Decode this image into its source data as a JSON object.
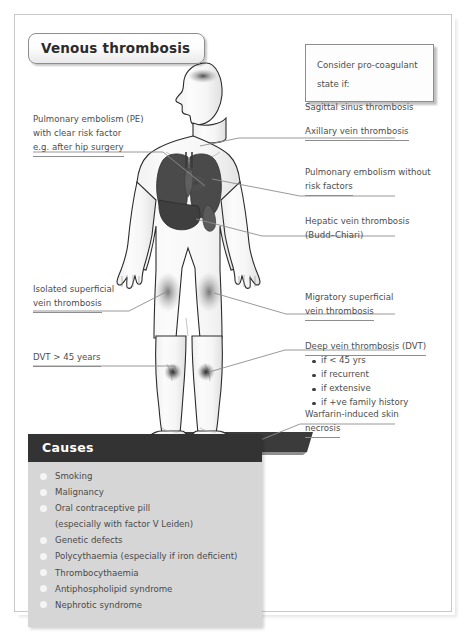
{
  "page": {
    "title_chip": "Venous thrombosis"
  },
  "pro_coagulant_box": {
    "line1": "Consider pro-coagulant",
    "line2": "state if:"
  },
  "labels": {
    "pe_with_risk": {
      "line1": "Pulmonary embolism (PE)",
      "line2": "with clear risk factor",
      "line3": "e.g. after hip surgery"
    },
    "isolated_superficial": {
      "line1": "Isolated superficial",
      "line2": "vein thrombosis"
    },
    "dvt_over_45": {
      "line1": "DVT > 45 years"
    },
    "sagittal": {
      "line1": "Sagittal sinus thrombosis"
    },
    "axillary": {
      "line1": "Axillary vein thrombosis"
    },
    "pe_without_risk": {
      "line1": "Pulmonary embolism without",
      "line2": "risk factors"
    },
    "hepatic": {
      "line1": "Hepatic vein thrombosis",
      "line2": "(Budd–Chiari)"
    },
    "migratory": {
      "line1": "Migratory superficial",
      "line2": "vein thrombosis"
    },
    "dvt": {
      "line1": "Deep vein thrombosis (DVT)",
      "bullets": [
        "if < 45 yrs",
        "if recurrent",
        "if extensive",
        "if +ve family history"
      ]
    },
    "warfarin": {
      "line1": "Warfarin-induced skin",
      "line2": "necrosis"
    }
  },
  "causes": {
    "heading": "Causes",
    "items": [
      {
        "text": "Smoking",
        "dot": true
      },
      {
        "text": "Malignancy",
        "dot": true
      },
      {
        "text": "Oral contraceptive pill",
        "dot": true
      },
      {
        "text": "(especially with factor V Leiden)",
        "dot": false
      },
      {
        "text": "Genetic defects",
        "dot": true
      },
      {
        "text": "Polycythaemia (especially if iron deficient)",
        "dot": true
      },
      {
        "text": "Thrombocythaemia",
        "dot": true
      },
      {
        "text": "Antiphospholipid syndrome",
        "dot": true
      },
      {
        "text": "Nephrotic syndrome",
        "dot": true
      }
    ]
  },
  "figure": {
    "name": "human-body-anterior-silhouette",
    "organs": [
      "lungs",
      "liver",
      "spleen"
    ],
    "hotspots": [
      "skull-sagittal-sinus",
      "left-thigh",
      "right-thigh",
      "left-calf",
      "right-calf"
    ]
  },
  "colors": {
    "ink": "#4d4d4d",
    "leader": "#8d8d8d",
    "causes_header_bg": "#333333",
    "causes_body_bg": "#d6d6d6",
    "organ_dark": "#454545",
    "frame": "#c9c9c9"
  }
}
